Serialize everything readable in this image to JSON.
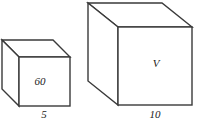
{
  "figure": {
    "type": "geometry-diagram",
    "stroke_color": "#3a3a3a",
    "fill_color": "#ffffff",
    "shapes": [
      {
        "name": "small-cube",
        "front_face_label": "60",
        "base_dimension_label": "5",
        "front": {
          "x": 19,
          "y": 57,
          "w": 51,
          "h": 49
        },
        "depth_dx": -17,
        "depth_dy": -17
      },
      {
        "name": "large-cube",
        "front_face_label": "V",
        "base_dimension_label": "10",
        "front": {
          "x": 118,
          "y": 27,
          "w": 74,
          "h": 78
        },
        "depth_dx": -30,
        "depth_dy": -24
      }
    ]
  }
}
